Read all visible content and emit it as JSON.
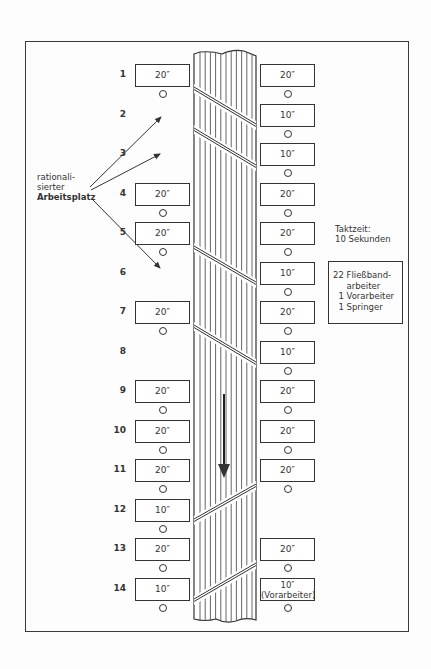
{
  "diagram": {
    "type": "assembly-line-layout",
    "annotation_label": [
      "rationali-",
      "sierter",
      "Arbeitsplatz"
    ],
    "cycle_time": {
      "line1": "Taktzeit:",
      "line2": "10 Sekunden"
    },
    "staff_box": [
      "22 Fließband-",
      "     arbeiter",
      "  1 Vorarbeiter",
      "  1 Springer"
    ],
    "flow_direction": "down",
    "rows": [
      {
        "num": "1",
        "left": "20″",
        "right": "20″"
      },
      {
        "num": "2",
        "left": null,
        "right": "10″"
      },
      {
        "num": "3",
        "left": null,
        "right": "10″"
      },
      {
        "num": "4",
        "left": "20″",
        "right": "20″"
      },
      {
        "num": "5",
        "left": "20″",
        "right": "20″"
      },
      {
        "num": "6",
        "left": null,
        "right": "10″"
      },
      {
        "num": "7",
        "left": "20″",
        "right": "20″"
      },
      {
        "num": "8",
        "left": null,
        "right": "10″"
      },
      {
        "num": "9",
        "left": "20″",
        "right": "20″"
      },
      {
        "num": "10",
        "left": "20″",
        "right": "20″"
      },
      {
        "num": "11",
        "left": "20″",
        "right": "20″"
      },
      {
        "num": "12",
        "left": "10″",
        "right": null
      },
      {
        "num": "13",
        "left": "20″",
        "right": "20″"
      },
      {
        "num": "14",
        "left": "10″",
        "right": "10″",
        "right_note": "(Vorarbeiter)"
      }
    ],
    "colors": {
      "ink": "#333333",
      "paper": "#fdfdfd"
    }
  }
}
